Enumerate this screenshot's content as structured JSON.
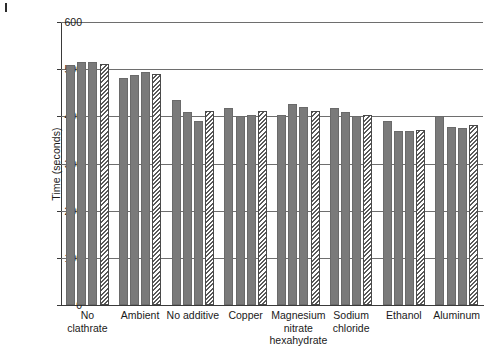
{
  "figure": {
    "corner_mark": "printers-corner-mark"
  },
  "chart_data": {
    "type": "bar",
    "title": "",
    "xlabel": "",
    "ylabel": "Time (seconds)",
    "ylim": [
      0,
      600
    ],
    "yticks": [
      0,
      100,
      200,
      300,
      400,
      500,
      600
    ],
    "ytick_labels": [
      "0",
      "100",
      "200",
      "300",
      "400",
      "500",
      "600"
    ],
    "grid": true,
    "legend_position": "none",
    "categories": [
      "No clathrate",
      "Ambient",
      "No additive",
      "Copper",
      "Magnesium nitrate hexahydrate",
      "Sodium chloride",
      "Ethanol",
      "Aluminum"
    ],
    "category_lines": [
      [
        "No",
        "clathrate"
      ],
      [
        "Ambient"
      ],
      [
        "No additive"
      ],
      [
        "Copper"
      ],
      [
        "Magnesium",
        "nitrate",
        "hexahydrate"
      ],
      [
        "Sodium",
        "chloride"
      ],
      [
        "Ethanol"
      ],
      [
        "Aluminum"
      ]
    ],
    "series": [
      {
        "name": "Run 1",
        "style": "solid-gray",
        "values": [
          508,
          481,
          435,
          418,
          402,
          418,
          390,
          400
        ]
      },
      {
        "name": "Run 2",
        "style": "solid-gray",
        "values": [
          515,
          487,
          409,
          401,
          427,
          410,
          368,
          378
        ]
      },
      {
        "name": "Run 3",
        "style": "solid-gray",
        "values": [
          515,
          494,
          390,
          402,
          420,
          400,
          368,
          375
        ]
      },
      {
        "name": "Run 4",
        "style": "white-hatched",
        "values": [
          512,
          489,
          412,
          412,
          412,
          403,
          372,
          382
        ]
      }
    ],
    "colors": {
      "solid_bar": "#7a7a7a",
      "hatch_bar_fill": "#ffffff",
      "hatch_bar_line": "#5a5a5a",
      "gridline": "#6e6e6e",
      "axis": "#3a3a3a",
      "text": "#1a1a1a",
      "background": "#ffffff"
    }
  }
}
